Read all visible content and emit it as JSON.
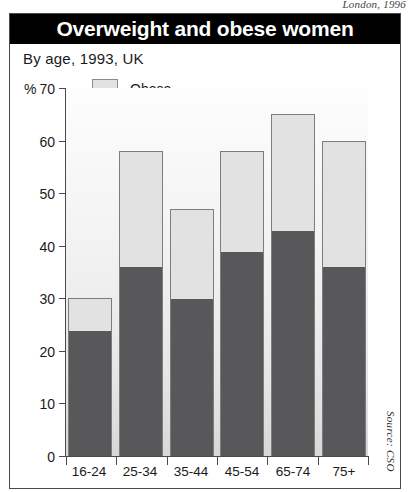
{
  "page": {
    "credit": "London, 1996"
  },
  "header": {
    "title": "Overweight and obese women"
  },
  "subtitle": "By age, 1993, UK",
  "axis": {
    "percent_sign": "%"
  },
  "legend": [
    {
      "label": "Obese",
      "color": "#e2e2e2",
      "key": "obese"
    },
    {
      "label": "Overweight",
      "color": "#58585a",
      "key": "overweight"
    }
  ],
  "source": "Source: CSO",
  "chart_data": {
    "type": "bar",
    "stacked": true,
    "title": "Overweight and obese women",
    "subtitle": "By age, 1993, UK",
    "xlabel": "",
    "ylabel": "%",
    "ylim": [
      0,
      70
    ],
    "yticks": [
      0,
      10,
      20,
      30,
      40,
      50,
      60,
      70
    ],
    "grid": false,
    "legend_position": "top-left-inside",
    "categories": [
      "16-24",
      "25-34",
      "35-44",
      "45-54",
      "65-74",
      "75+"
    ],
    "series": [
      {
        "name": "Overweight",
        "color": "#58585a",
        "values": [
          24,
          36,
          30,
          39,
          43,
          36
        ]
      },
      {
        "name": "Obese",
        "color": "#e2e2e2",
        "values": [
          6,
          22,
          17,
          19,
          22,
          24
        ]
      }
    ],
    "totals": [
      30,
      58,
      47,
      58,
      65,
      60
    ],
    "annotations": [
      "Source: CSO",
      "London, 1996"
    ]
  }
}
